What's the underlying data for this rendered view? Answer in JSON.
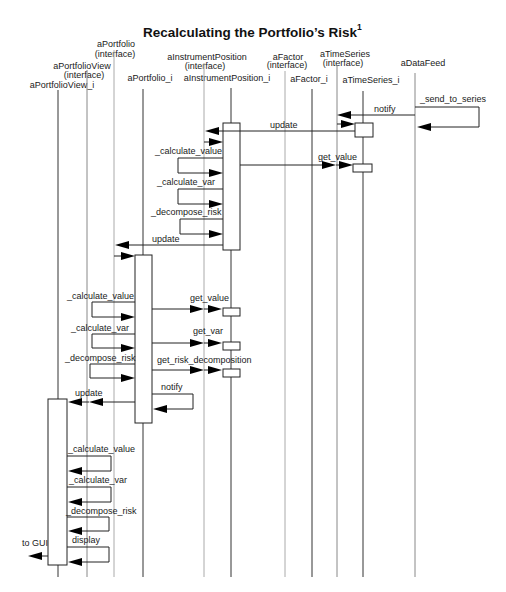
{
  "title": {
    "text": "Recalculating the Portfolio’s Risk",
    "footnote_mark": "1"
  },
  "lifelines": [
    {
      "name": "aPortfolioView_i"
    },
    {
      "name": "aPortfolioView",
      "stereotype": "(interface)"
    },
    {
      "name": "aPortfolio",
      "stereotype": "(interface)"
    },
    {
      "name": "aPortfolio_i"
    },
    {
      "name": "aInstrumentPosition",
      "stereotype": "(interface)"
    },
    {
      "name": "aInstrumentPosition_i"
    },
    {
      "name": "aFactor",
      "stereotype": "(interface)"
    },
    {
      "name": "aFactor_i"
    },
    {
      "name": "aTimeSeries",
      "stereotype": "(interface)"
    },
    {
      "name": "aTimeSeries_i"
    },
    {
      "name": "aDataFeed"
    }
  ],
  "messages": [
    {
      "label": "_send_to_series",
      "from": "aDataFeed",
      "to": "aDataFeed"
    },
    {
      "label": "notify",
      "from": "aDataFeed",
      "to": "aTimeSeries_i"
    },
    {
      "label": "update",
      "from": "aTimeSeries_i",
      "to": "aInstrumentPosition_i"
    },
    {
      "label": "_calculate_value",
      "from": "aInstrumentPosition_i",
      "to": "aInstrumentPosition_i"
    },
    {
      "label": "get_value",
      "from": "aInstrumentPosition_i",
      "to": "aTimeSeries_i"
    },
    {
      "label": "_calculate_var",
      "from": "aInstrumentPosition_i",
      "to": "aInstrumentPosition_i"
    },
    {
      "label": "_decompose_risk",
      "from": "aInstrumentPosition_i",
      "to": "aInstrumentPosition_i"
    },
    {
      "label": "update",
      "from": "aInstrumentPosition_i",
      "to": "aPortfolio_i"
    },
    {
      "label": "_calculate_value",
      "from": "aPortfolio_i",
      "to": "aPortfolio_i"
    },
    {
      "label": "get_value",
      "from": "aPortfolio_i",
      "to": "aInstrumentPosition_i"
    },
    {
      "label": "_calculate_var",
      "from": "aPortfolio_i",
      "to": "aPortfolio_i"
    },
    {
      "label": "get_var",
      "from": "aPortfolio_i",
      "to": "aInstrumentPosition_i"
    },
    {
      "label": "_decompose_risk",
      "from": "aPortfolio_i",
      "to": "aPortfolio_i"
    },
    {
      "label": "get_risk_decomposition",
      "from": "aPortfolio_i",
      "to": "aInstrumentPosition_i"
    },
    {
      "label": "notify",
      "from": "aPortfolio_i",
      "to": "aPortfolio_i"
    },
    {
      "label": "update",
      "from": "aPortfolio_i",
      "to": "aPortfolioView_i"
    },
    {
      "label": "_calculate_value",
      "from": "aPortfolioView_i",
      "to": "aPortfolioView_i"
    },
    {
      "label": "_calculate_var",
      "from": "aPortfolioView_i",
      "to": "aPortfolioView_i"
    },
    {
      "label": "_decompose_risk",
      "from": "aPortfolioView_i",
      "to": "aPortfolioView_i"
    },
    {
      "label": "display",
      "from": "aPortfolioView_i",
      "to": "aPortfolioView_i"
    },
    {
      "label": "to GUI",
      "from": "aPortfolioView_i",
      "to": "GUI"
    }
  ]
}
